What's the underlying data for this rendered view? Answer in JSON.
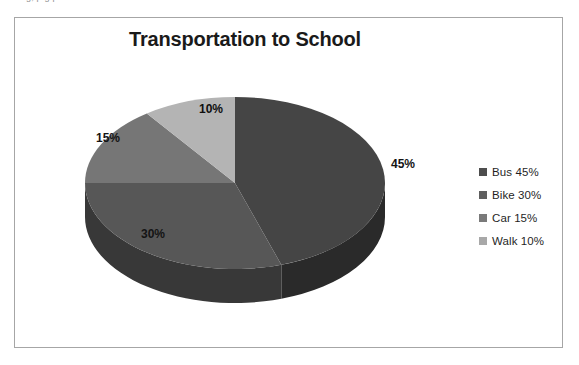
{
  "scan_artifact": {
    "text": "g,    p         g p"
  },
  "chart": {
    "title": "Transportation to School",
    "frame_border_color": "#a6a6a6",
    "background_color": "#ffffff"
  },
  "legend": {
    "position": "right",
    "items": [
      {
        "label": "Bus 45%",
        "swatch_color": "#4d4d4d"
      },
      {
        "label": "Bike 30%",
        "swatch_color": "#5f5f5f"
      },
      {
        "label": "Car 15%",
        "swatch_color": "#7a7a7a"
      },
      {
        "label": "Walk 10%",
        "swatch_color": "#a8a8a8"
      }
    ]
  },
  "chart_data": {
    "type": "pie",
    "title": "Transportation to School",
    "xlabel": "",
    "ylabel": "",
    "three_d": true,
    "start_angle_deg": 0,
    "direction": "clockwise",
    "legend_position": "right",
    "grid": false,
    "categories": [
      "Bus",
      "Bike",
      "Car",
      "Walk"
    ],
    "values": [
      45,
      30,
      15,
      10
    ],
    "units": "percent",
    "data_labels": [
      "45%",
      "30%",
      "15%",
      "10%"
    ],
    "legend_entries": [
      "Bus 45%",
      "Bike 30%",
      "Car 15%",
      "Walk 10%"
    ],
    "slice_colors": [
      "#454545",
      "#575757",
      "#767676",
      "#b4b4b4"
    ],
    "slice_side_colors": [
      "#2a2a2a",
      "#383838",
      "#4f4f4f",
      "#7d7d7d"
    ]
  }
}
